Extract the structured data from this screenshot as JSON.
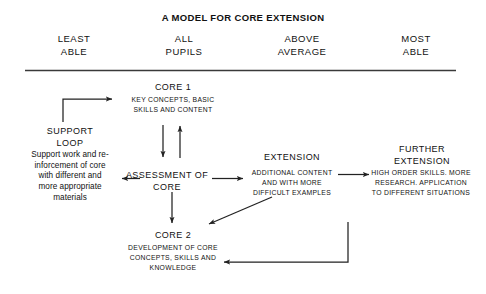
{
  "title": "A MODEL FOR CORE EXTENSION",
  "column_headers": [
    "LEAST\nABLE",
    "ALL\nPUPILS",
    "ABOVE\nAVERAGE",
    "MOST\nABLE"
  ],
  "nodes": {
    "core1": {
      "title": "CORE 1",
      "body": "KEY CONCEPTS, BASIC\nSKILLS AND CONTENT"
    },
    "support_loop": {
      "title": "SUPPORT\nLOOP",
      "body": "Support work and re-\ninforcement of core\nwith different and\nmore appropriate\nmaterials"
    },
    "assessment": {
      "title": "ASSESSMENT OF\nCORE"
    },
    "extension": {
      "title": "EXTENSION",
      "body": "ADDITIONAL CONTENT\nAND WITH MORE\nDIFFICULT EXAMPLES"
    },
    "further_extension": {
      "title": "FURTHER\nEXTENSION",
      "body": "HIGH ORDER SKILLS. MORE\nRESEARCH. APPLICATION\nTO DIFFERENT SITUATIONS"
    },
    "core2": {
      "title": "CORE 2",
      "body": "DEVELOPMENT OF CORE\nCONCEPTS, SKILLS AND\nKNOWLEDGE"
    }
  },
  "connectors": [
    {
      "name": "support-loop-to-core1",
      "kind": "elbow-up-right"
    },
    {
      "name": "assessment-to-support-loop",
      "kind": "arrow-left"
    },
    {
      "name": "core1-to-assessment",
      "kind": "arrow-down"
    },
    {
      "name": "assessment-to-core1",
      "kind": "arrow-up"
    },
    {
      "name": "assessment-to-core2",
      "kind": "arrow-down"
    },
    {
      "name": "assessment-to-extension",
      "kind": "arrow-right"
    },
    {
      "name": "extension-to-further-extension",
      "kind": "arrow-right"
    },
    {
      "name": "extension-to-core2",
      "kind": "diagonal-arrow-down-left"
    },
    {
      "name": "further-extension-to-core2",
      "kind": "elbow-down-left"
    }
  ],
  "rule": {
    "name": "header-divider"
  },
  "colors": {
    "ink": "#111111",
    "line": "#333333",
    "background": "#ffffff"
  }
}
